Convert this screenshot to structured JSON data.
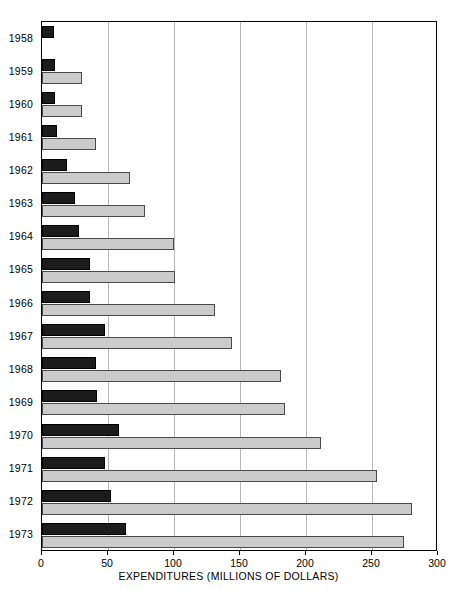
{
  "chart_data": {
    "type": "bar",
    "orientation": "horizontal",
    "title": "",
    "xlabel": "EXPENDITURES (MILLIONS OF DOLLARS)",
    "ylabel": "",
    "xlim": [
      0,
      300
    ],
    "xticks": [
      0,
      50,
      100,
      150,
      200,
      250,
      300
    ],
    "xtick_labels": [
      "0",
      "50",
      "100",
      "150",
      "200",
      "250",
      "300"
    ],
    "grid": "vertical",
    "legend": "none",
    "categories": [
      "1958",
      "1959",
      "1960",
      "1961",
      "1962",
      "1963",
      "1964",
      "1965",
      "1966",
      "1967",
      "1968",
      "1969",
      "1970",
      "1971",
      "1972",
      "1973"
    ],
    "series": [
      {
        "name": "dark-series",
        "color": "#1c1c1c",
        "values": [
          9,
          10,
          10,
          11,
          19,
          25,
          28,
          36,
          36,
          48,
          41,
          42,
          58,
          48,
          52,
          64
        ]
      },
      {
        "name": "light-series",
        "color": "#cbcbcb",
        "values": [
          0,
          30,
          30,
          41,
          67,
          78,
          100,
          101,
          131,
          144,
          181,
          184,
          211,
          254,
          280,
          274
        ]
      }
    ]
  },
  "axis": {
    "x_title": "EXPENDITURES (MILLIONS OF DOLLARS)"
  }
}
